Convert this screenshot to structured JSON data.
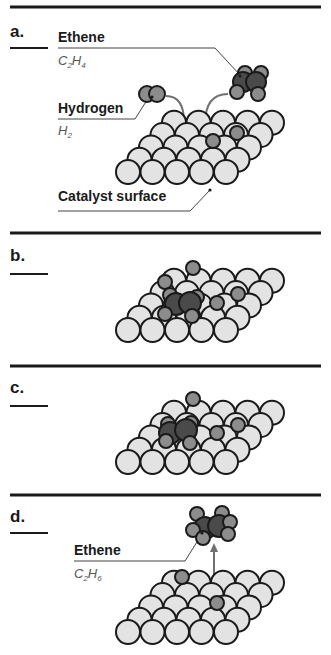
{
  "figure": {
    "colors": {
      "rule": "#1a1a1a",
      "surface_atom": "#e3e3e3",
      "atom_outline": "#1a1a1a",
      "hydrogen_atom": "#8c8c8c",
      "carbon_atom": "#4a4a4a",
      "arrow": "#707070",
      "leader_line": "#444444"
    },
    "panels": [
      {
        "id": "a",
        "label": "a.",
        "labels": {
          "ethene_name": "Ethene",
          "ethene_formula_c": "C",
          "ethene_formula_c_sub": "2",
          "ethene_formula_h": "H",
          "ethene_formula_h_sub": "4",
          "hydrogen_name": "Hydrogen",
          "hydrogen_formula_h": "H",
          "hydrogen_formula_h_sub": "2",
          "catalyst_name": "Catalyst surface"
        }
      },
      {
        "id": "b",
        "label": "b."
      },
      {
        "id": "c",
        "label": "c."
      },
      {
        "id": "d",
        "label": "d.",
        "labels": {
          "product_name": "Ethene",
          "product_formula_c": "C",
          "product_formula_c_sub": "2",
          "product_formula_h": "H",
          "product_formula_h_sub": "6"
        }
      }
    ]
  },
  "lattice": {
    "rows": 5,
    "cols": 5,
    "radius": 12,
    "dx": 24.5,
    "row_dx": 11.5,
    "row_dy": -12.3,
    "origins": [
      {
        "panel": "a",
        "x": 128,
        "y": 172
      },
      {
        "panel": "b",
        "x": 128,
        "y": 330
      },
      {
        "panel": "c",
        "x": 128,
        "y": 462
      },
      {
        "panel": "d",
        "x": 128,
        "y": 632
      }
    ]
  },
  "molecules": {
    "a": [
      {
        "type": "H",
        "x": 147,
        "y": 94,
        "r": 8
      },
      {
        "type": "H",
        "x": 157,
        "y": 94,
        "r": 8
      },
      {
        "type": "H",
        "x": 245,
        "y": 73,
        "r": 7
      },
      {
        "type": "H",
        "x": 261,
        "y": 73,
        "r": 7
      },
      {
        "type": "C",
        "x": 243,
        "y": 82,
        "r": 10
      },
      {
        "type": "C",
        "x": 256,
        "y": 82,
        "r": 10
      },
      {
        "type": "H",
        "x": 237,
        "y": 92,
        "r": 7
      },
      {
        "type": "H",
        "x": 258,
        "y": 94,
        "r": 7
      },
      {
        "type": "H",
        "x": 213,
        "y": 141,
        "r": 7
      },
      {
        "type": "H",
        "x": 237,
        "y": 133,
        "r": 7
      }
    ],
    "b": [
      {
        "type": "H",
        "x": 193,
        "y": 268,
        "r": 7
      },
      {
        "type": "H",
        "x": 165,
        "y": 282,
        "r": 7
      },
      {
        "type": "H",
        "x": 170,
        "y": 295,
        "r": 7
      },
      {
        "type": "H",
        "x": 197,
        "y": 297,
        "r": 7
      },
      {
        "type": "C",
        "x": 176,
        "y": 304,
        "r": 11
      },
      {
        "type": "C",
        "x": 190,
        "y": 303,
        "r": 11
      },
      {
        "type": "H",
        "x": 165,
        "y": 314,
        "r": 7
      },
      {
        "type": "H",
        "x": 192,
        "y": 316,
        "r": 7
      },
      {
        "type": "H",
        "x": 217,
        "y": 303,
        "r": 7
      },
      {
        "type": "H",
        "x": 238,
        "y": 294,
        "r": 7
      }
    ],
    "c": [
      {
        "type": "H",
        "x": 193,
        "y": 399,
        "r": 7
      },
      {
        "type": "H",
        "x": 168,
        "y": 424,
        "r": 7
      },
      {
        "type": "H",
        "x": 191,
        "y": 423,
        "r": 7
      },
      {
        "type": "C",
        "x": 170,
        "y": 433,
        "r": 11
      },
      {
        "type": "C",
        "x": 186,
        "y": 430,
        "r": 11
      },
      {
        "type": "H",
        "x": 166,
        "y": 441,
        "r": 7
      },
      {
        "type": "H",
        "x": 190,
        "y": 443,
        "r": 7
      },
      {
        "type": "H",
        "x": 217,
        "y": 433,
        "r": 7
      },
      {
        "type": "H",
        "x": 238,
        "y": 425,
        "r": 7
      }
    ],
    "d": [
      {
        "type": "H",
        "x": 197,
        "y": 514,
        "r": 7
      },
      {
        "type": "H",
        "x": 222,
        "y": 513,
        "r": 7
      },
      {
        "type": "C",
        "x": 205,
        "y": 528,
        "r": 11
      },
      {
        "type": "C",
        "x": 219,
        "y": 526,
        "r": 11
      },
      {
        "type": "H",
        "x": 230,
        "y": 522,
        "r": 7
      },
      {
        "type": "H",
        "x": 193,
        "y": 530,
        "r": 7
      },
      {
        "type": "H",
        "x": 203,
        "y": 538,
        "r": 7
      },
      {
        "type": "H",
        "x": 228,
        "y": 534,
        "r": 7
      },
      {
        "type": "H",
        "x": 182,
        "y": 577,
        "r": 7
      },
      {
        "type": "H",
        "x": 217,
        "y": 603,
        "r": 7
      }
    ]
  },
  "rules": [
    {
      "y": 7
    },
    {
      "y": 233
    },
    {
      "y": 366
    },
    {
      "y": 495
    }
  ]
}
